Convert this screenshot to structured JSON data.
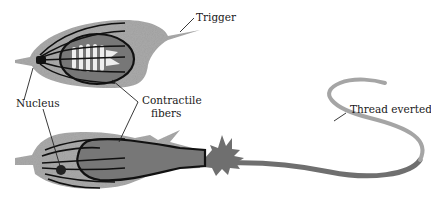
{
  "diagram": {
    "labels": {
      "trigger": "Trigger",
      "nucleus": "Nucleus",
      "contractile_line1": "Contractile",
      "contractile_line2": "fibers",
      "thread": "Thread everted"
    },
    "states": [
      "Coiled thread (before discharge)",
      "Thread everted (after discharge)"
    ],
    "colors": {
      "cell_body": "#aaaaaa",
      "capsule": "#777777",
      "thread": "#6f6f6f",
      "thread_light": "#a5a5a5",
      "fibers": "#111111",
      "background": "#ffffff"
    }
  }
}
